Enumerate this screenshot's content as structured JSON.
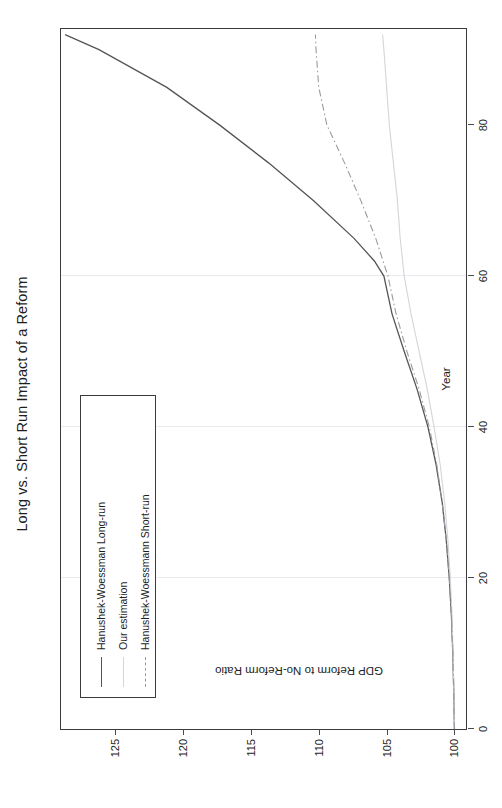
{
  "chart_data": {
    "type": "line",
    "title": "Long vs. Short Run Impact of a Reform",
    "xlabel": "Year",
    "ylabel": "GDP Reform to No-Reform Ratio",
    "xlim": [
      0,
      93
    ],
    "ylim": [
      99,
      129
    ],
    "xticks": [
      0,
      20,
      40,
      60,
      80
    ],
    "yticks": [
      100,
      105,
      110,
      115,
      120,
      125
    ],
    "grid": true,
    "gridlines_x": [
      20,
      40,
      60
    ],
    "legend_position": "top-left",
    "orientation": "rotated-90",
    "series": [
      {
        "name": "Hanushek-Woessman Long-run",
        "style": "solid",
        "color": "#555555",
        "x": [
          0,
          5,
          10,
          15,
          20,
          25,
          30,
          35,
          40,
          45,
          50,
          55,
          60,
          62,
          65,
          70,
          75,
          80,
          85,
          90,
          92
        ],
        "y": [
          100.0,
          100.05,
          100.12,
          100.22,
          100.38,
          100.6,
          100.9,
          101.35,
          101.95,
          102.75,
          103.7,
          104.6,
          105.2,
          105.9,
          107.4,
          110.4,
          113.7,
          117.3,
          121.2,
          126.2,
          128.7
        ]
      },
      {
        "name": "Our estimation",
        "style": "solid-light",
        "color": "#d5d5da",
        "x": [
          0,
          5,
          10,
          15,
          20,
          25,
          30,
          35,
          40,
          45,
          50,
          55,
          60,
          65,
          70,
          75,
          80,
          85,
          90,
          92
        ],
        "y": [
          100.0,
          100.04,
          100.1,
          100.18,
          100.3,
          100.48,
          100.72,
          101.05,
          101.5,
          102.0,
          102.6,
          103.2,
          103.7,
          104.0,
          104.2,
          104.5,
          104.8,
          105.0,
          105.2,
          105.3
        ]
      },
      {
        "name": "Hanushek-Woessmann Short-run",
        "style": "dash-dot",
        "color": "#9a9aa2",
        "x": [
          0,
          5,
          10,
          15,
          20,
          25,
          30,
          35,
          40,
          45,
          50,
          55,
          60,
          65,
          70,
          75,
          80,
          85,
          90,
          92
        ],
        "y": [
          100.0,
          100.05,
          100.12,
          100.22,
          100.38,
          100.6,
          100.9,
          101.3,
          101.85,
          102.6,
          103.5,
          104.3,
          104.9,
          105.8,
          106.9,
          108.1,
          109.4,
          110.0,
          110.2,
          110.25
        ]
      }
    ]
  },
  "legend": {
    "items": [
      {
        "label": "Hanushek-Woessman Long-run"
      },
      {
        "label": "Our estimation"
      },
      {
        "label": "Hanushek-Woessmann Short-run"
      }
    ]
  },
  "colors": {
    "frame": "#3b3b3b",
    "grid": "#e9e9ee",
    "background": "#ffffff"
  }
}
